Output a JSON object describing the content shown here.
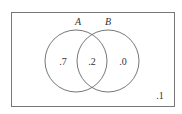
{
  "diagram": {
    "type": "venn",
    "sets": [
      {
        "name": "A",
        "label": "A"
      },
      {
        "name": "B",
        "label": "B"
      }
    ],
    "regions": {
      "a_only": ".7",
      "a_and_b": ".2",
      "b_only": ".0",
      "outside": ".1"
    },
    "colors": {
      "stroke": "#777777",
      "text": "#333333",
      "background": "#ffffff"
    }
  }
}
